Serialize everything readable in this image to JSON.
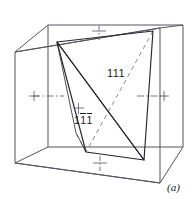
{
  "figure": {
    "caption": "(a)",
    "type": "crystallographic-cube-diagram",
    "background_color": "#ffffff",
    "line_color": "#4a4a52",
    "plane_edge_color": "#1a1a1a",
    "text_color": "#1a1a1a",
    "labels": [
      {
        "id": "plane-111",
        "text": "111",
        "digits": [
          "1",
          "1",
          "1"
        ],
        "overbars": [
          false,
          false,
          false
        ]
      },
      {
        "id": "plane-1bar1bar1bar",
        "text": "1̄1̄1̄",
        "digits": [
          "1",
          "1",
          "1"
        ],
        "overbars": [
          false,
          true,
          true
        ]
      }
    ],
    "axes": [
      {
        "id": "axis-left",
        "style": "dash-dot",
        "marker": "plus",
        "orientation": "horizontal"
      },
      {
        "id": "axis-right",
        "style": "dash-dot",
        "marker": "plus",
        "orientation": "horizontal"
      },
      {
        "id": "axis-top",
        "style": "dash-dot",
        "marker": "plus",
        "orientation": "vertical"
      },
      {
        "id": "axis-bottom",
        "style": "dash-dot",
        "marker": "plus",
        "orientation": "vertical"
      },
      {
        "id": "axis-center",
        "style": "dash-dot",
        "marker": "plus",
        "orientation": "vertical"
      }
    ],
    "cube": {
      "description": "outlined cube drawn in oblique projection",
      "vertices": {
        "front_top_left": [
          15,
          52
        ],
        "front_top_right": [
          160,
          28
        ],
        "front_bot_left": [
          15,
          163
        ],
        "front_bot_right": [
          160,
          150
        ],
        "back_top_left": [
          48,
          25
        ],
        "back_top_right": [
          183,
          25
        ],
        "back_bot_left": [
          48,
          147
        ],
        "back_bot_right": [
          183,
          147
        ]
      }
    },
    "planes": [
      {
        "id": "plane-111-triangle",
        "label": "111",
        "style": "solid-and-dashed-edges",
        "vertices": [
          [
            57,
            42
          ],
          [
            153,
            31
          ],
          [
            144,
            160
          ]
        ]
      },
      {
        "id": "plane-1bar1bar1bar-triangle",
        "label": "1̄1̄1̄",
        "style": "solid-edges",
        "vertices": [
          [
            57,
            42
          ],
          [
            144,
            160
          ],
          [
            86,
            152
          ]
        ]
      }
    ]
  }
}
